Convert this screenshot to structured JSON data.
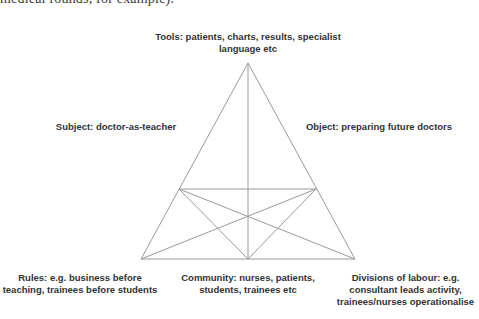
{
  "page": {
    "clipped_text": "medical rounds, for example).",
    "ghost_lines": [
      "",
      "",
      ""
    ]
  },
  "diagram": {
    "type": "activity-theory-triangle",
    "line_color": "#9a9a9a",
    "text_color": "#333333",
    "nodes": {
      "tools": {
        "lines": [
          "Tools: patients, charts, results, specialist",
          "language etc"
        ]
      },
      "subject": {
        "lines": [
          "Subject: doctor-as-teacher"
        ]
      },
      "object": {
        "lines": [
          "Object: preparing future doctors"
        ]
      },
      "rules": {
        "lines": [
          "Rules: e.g. business before",
          "teaching, trainees before students"
        ]
      },
      "community": {
        "lines": [
          "Community: nurses, patients,",
          "students, trainees etc"
        ]
      },
      "division": {
        "lines": [
          "Divisions of labour: e.g.",
          "consultant leads activity,",
          "trainees/nurses operationalise"
        ]
      }
    }
  }
}
